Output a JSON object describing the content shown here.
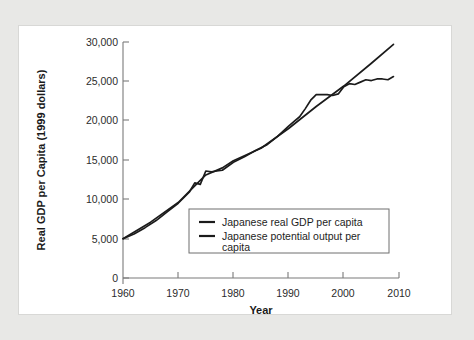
{
  "chart_data": {
    "type": "line",
    "title": "",
    "xlabel": "Year",
    "ylabel": "Real GDP per Capita (1999 dollars)",
    "xlim": [
      1960,
      2010
    ],
    "ylim": [
      0,
      30000
    ],
    "grid": false,
    "legend_position": "center-right-inside",
    "xticks": [
      1960,
      1970,
      1980,
      1990,
      2000,
      2010
    ],
    "xtick_labels": [
      "1960",
      "1970",
      "1980",
      "1990",
      "2000",
      "2010"
    ],
    "yticks": [
      0,
      5000,
      10000,
      15000,
      20000,
      25000,
      30000
    ],
    "ytick_labels": [
      "0",
      "5,000",
      "10,000",
      "15,000",
      "20,000",
      "25,000",
      "30,000"
    ],
    "series": [
      {
        "name": "Japanese real GDP per capita",
        "color": "#1b1b1b",
        "x": [
          1960,
          1962,
          1964,
          1966,
          1968,
          1970,
          1972,
          1973,
          1974,
          1975,
          1976,
          1977,
          1978,
          1979,
          1980,
          1982,
          1984,
          1986,
          1988,
          1990,
          1991,
          1992,
          1993,
          1994,
          1995,
          1996,
          1997,
          1998,
          1999,
          2000,
          2001,
          2002,
          2003,
          2004,
          2005,
          2006,
          2007,
          2008,
          2009
        ],
        "values": [
          5000,
          5600,
          6400,
          7300,
          8400,
          9500,
          10900,
          12100,
          11900,
          13600,
          13500,
          13600,
          13700,
          14200,
          14700,
          15400,
          16200,
          16900,
          18000,
          19300,
          19900,
          20500,
          21500,
          22600,
          23300,
          23300,
          23300,
          23200,
          23400,
          24300,
          24700,
          24600,
          24900,
          25200,
          25100,
          25300,
          25300,
          25200,
          25600
        ]
      },
      {
        "name": "Japanese potential output per capita",
        "color": "#1b1b1b",
        "x": [
          1960,
          1965,
          1970,
          1973,
          1975,
          1978,
          1980,
          1985,
          1990,
          1995,
          2000,
          2005,
          2009
        ],
        "values": [
          5000,
          7100,
          9600,
          11700,
          13100,
          14000,
          14900,
          16500,
          19000,
          21800,
          24400,
          27300,
          29700
        ]
      }
    ]
  },
  "legend": {
    "entries": [
      {
        "label": "Japanese real GDP per capita"
      },
      {
        "label": "Japanese potential output per capita"
      }
    ],
    "line2_wrap_a": "Japanese potential output per",
    "line2_wrap_b": "capita"
  }
}
